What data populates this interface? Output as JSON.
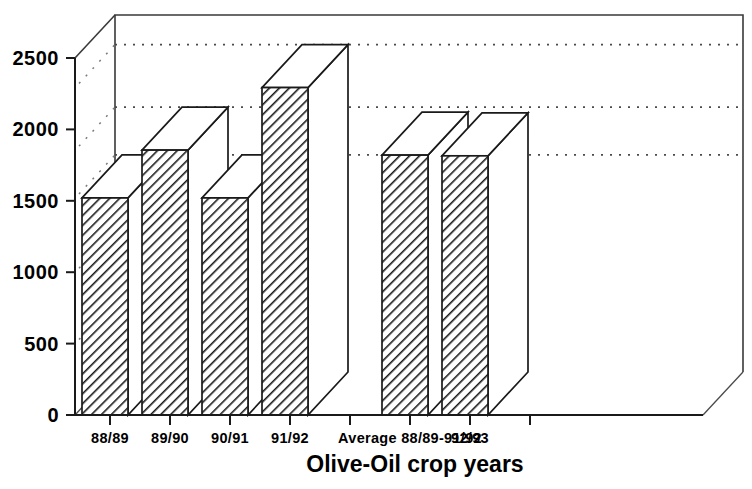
{
  "chart_data": {
    "type": "bar",
    "title": "",
    "xlabel": "Olive-Oil crop years",
    "ylabel": "",
    "categories": [
      "88/89",
      "89/90",
      "90/91",
      "91/92",
      "",
      "Average 88/89-91/92",
      "92/93"
    ],
    "values": [
      1520,
      1855,
      1520,
      2293,
      null,
      1820,
      1815
    ],
    "ylim": [
      0,
      2500
    ],
    "ytick_values": [
      0,
      500,
      1000,
      1500,
      2000,
      2500
    ],
    "ytick_labels": [
      "0",
      "500",
      "1000",
      "1500",
      "2000",
      "2500"
    ],
    "grid": "horizontal-dotted",
    "gridline_values": [
      2293,
      1855,
      1520
    ],
    "legend": null,
    "style": "3d-bars-hatched",
    "colors": {
      "bar_fill": "#ffffff",
      "bar_hatch": "#1a1a1a",
      "axis": "#1a1a1a",
      "frame": "#3a3a3a",
      "grid": "#4a4a4a",
      "text": "#000000",
      "background": "#ffffff"
    }
  },
  "axis": {
    "x_title": "Olive-Oil crop years"
  }
}
